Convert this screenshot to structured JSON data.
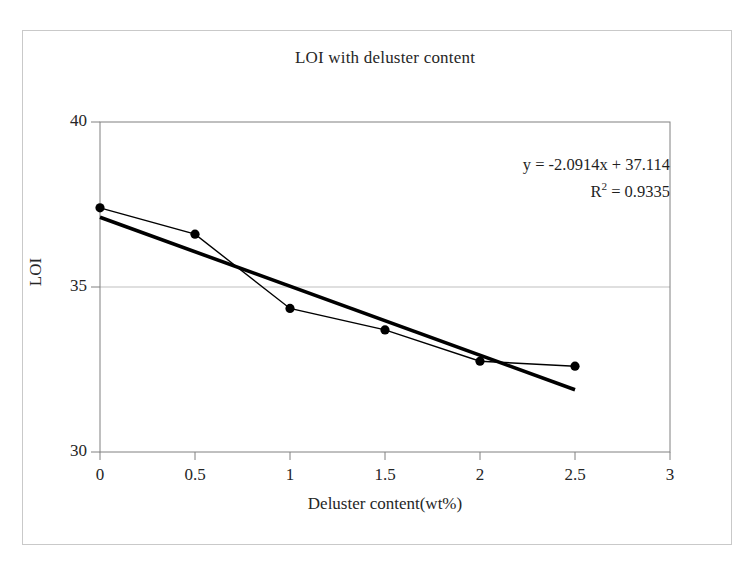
{
  "chart_data": {
    "type": "scatter",
    "title": "LOI with deluster content",
    "xlabel": "Deluster content(wt%)",
    "ylabel": "LOI",
    "xlim": [
      0,
      3
    ],
    "ylim": [
      30,
      40
    ],
    "xticks": [
      "0",
      "0.5",
      "1",
      "1.5",
      "2",
      "2.5",
      "3"
    ],
    "xtick_values": [
      0,
      0.5,
      1,
      1.5,
      2,
      2.5,
      3
    ],
    "yticks": [
      "30",
      "35",
      "40"
    ],
    "ytick_values": [
      30,
      35,
      40
    ],
    "grid": "horizontal-gridline-at-35",
    "legend": "none",
    "series": [
      {
        "name": "LOI measured",
        "style": "line-with-round-markers",
        "color": "#000000",
        "x": [
          0,
          0.5,
          1,
          1.5,
          2,
          2.5
        ],
        "values": [
          37.4,
          36.6,
          34.35,
          33.7,
          32.75,
          32.6
        ]
      },
      {
        "name": "Linear trendline",
        "style": "thick-solid-line",
        "color": "#000000",
        "slope": -2.0914,
        "intercept": 37.114,
        "x": [
          0,
          2.5
        ],
        "values": [
          37.114,
          31.8855
        ]
      }
    ],
    "annotations": {
      "equation": "y = -2.0914x + 37.114",
      "r_squared_label": "R",
      "r_squared_exponent": "2",
      "r_squared_value": "= 0.9335"
    }
  },
  "colors": {
    "frame": "#c9c9c9",
    "axis": "#808080",
    "gridline": "#bfbfbf",
    "data": "#000000",
    "text": "#262626"
  }
}
